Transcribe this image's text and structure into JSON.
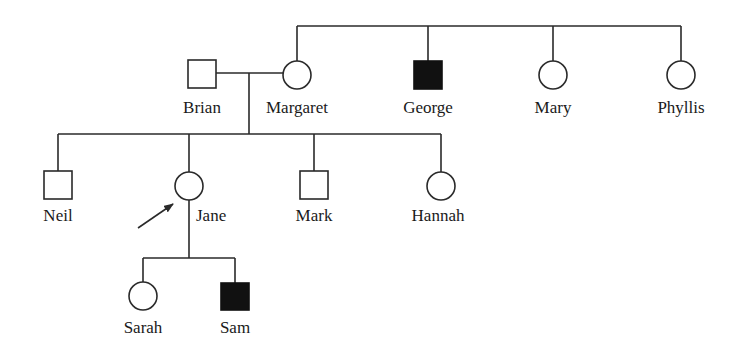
{
  "diagram": {
    "type": "pedigree",
    "colors": {
      "line": "#2a2a2a",
      "affected_fill": "#111111",
      "unaffected_fill": "#ffffff",
      "background": "#ffffff"
    },
    "legend": {
      "square": "male",
      "circle": "female",
      "filled": "affected",
      "arrow": "proband"
    },
    "generations": [
      {
        "index": 1,
        "individuals": [
          {
            "name": "Brian",
            "sex": "male",
            "affected": false
          },
          {
            "name": "Margaret",
            "sex": "female",
            "affected": false
          },
          {
            "name": "George",
            "sex": "male",
            "affected": true
          },
          {
            "name": "Mary",
            "sex": "female",
            "affected": false
          },
          {
            "name": "Phyllis",
            "sex": "female",
            "affected": false
          }
        ]
      },
      {
        "index": 2,
        "parents": [
          "Brian",
          "Margaret"
        ],
        "individuals": [
          {
            "name": "Neil",
            "sex": "male",
            "affected": false
          },
          {
            "name": "Jane",
            "sex": "female",
            "affected": false,
            "proband": true
          },
          {
            "name": "Mark",
            "sex": "male",
            "affected": false
          },
          {
            "name": "Hannah",
            "sex": "female",
            "affected": false
          }
        ]
      },
      {
        "index": 3,
        "parents": [
          "Jane"
        ],
        "individuals": [
          {
            "name": "Sarah",
            "sex": "female",
            "affected": false
          },
          {
            "name": "Sam",
            "sex": "male",
            "affected": true
          }
        ]
      }
    ],
    "sibships": [
      {
        "members": [
          "Margaret",
          "George",
          "Mary",
          "Phyllis"
        ]
      },
      {
        "members": [
          "Neil",
          "Jane",
          "Mark",
          "Hannah"
        ]
      },
      {
        "members": [
          "Sarah",
          "Sam"
        ]
      }
    ],
    "marriages": [
      {
        "partners": [
          "Brian",
          "Margaret"
        ]
      }
    ],
    "labels": {
      "brian": "Brian",
      "margaret": "Margaret",
      "george": "George",
      "mary": "Mary",
      "phyllis": "Phyllis",
      "neil": "Neil",
      "jane": "Jane",
      "mark": "Mark",
      "hannah": "Hannah",
      "sarah": "Sarah",
      "sam": "Sam"
    }
  }
}
